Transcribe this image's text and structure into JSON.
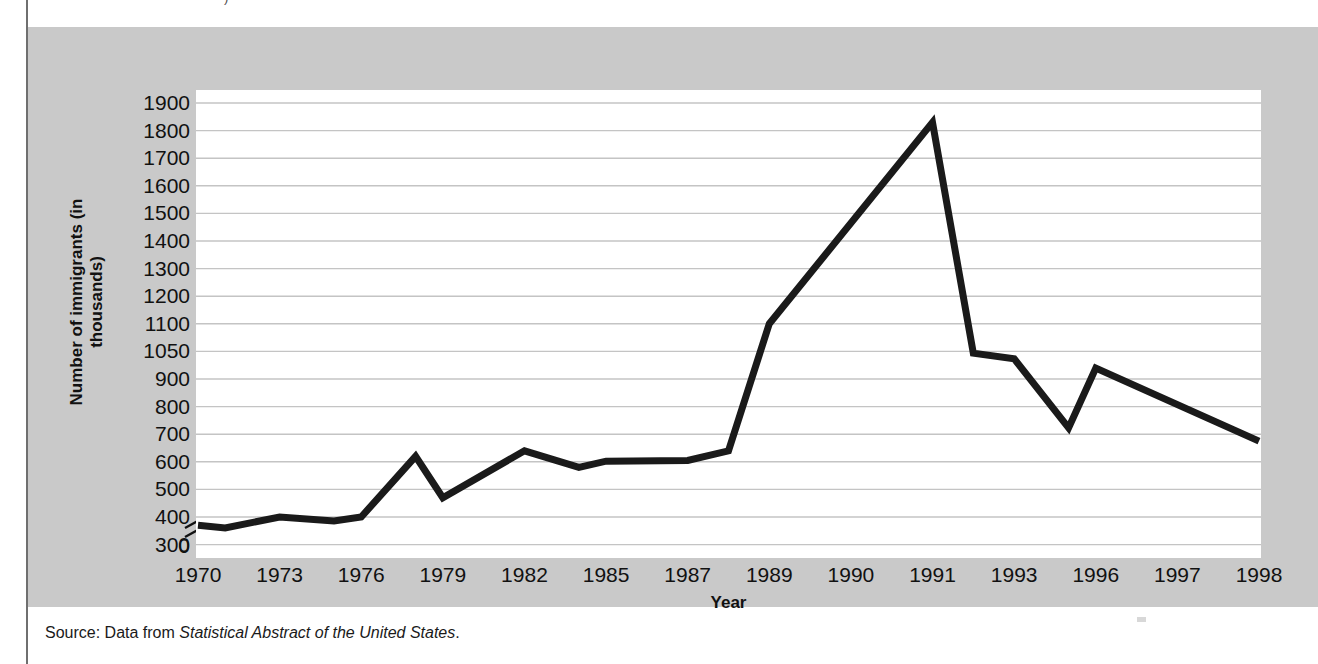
{
  "figure": {
    "top_fragment": ")",
    "source_prefix": "Source: Data from ",
    "source_italic": "Statistical Abstract of the United States",
    "source_suffix": "."
  },
  "colors": {
    "panel_background": "#c9c9c9",
    "plot_background": "#ffffff",
    "gridline": "#c4c4c4",
    "line": "#1a1a1a",
    "text": "#111111"
  },
  "chart_data": {
    "type": "line",
    "title": "",
    "xlabel": "Year",
    "ylabel": "Number of immigrants (in thousands)",
    "grid": true,
    "legend": false,
    "axis_break": true,
    "ytick_labels": [
      "1900",
      "1800",
      "1700",
      "1600",
      "1500",
      "1400",
      "1300",
      "1200",
      "1100",
      "1050",
      "900",
      "800",
      "700",
      "600",
      "500",
      "400",
      "300",
      "0"
    ],
    "xtick_labels": [
      "1970",
      "1973",
      "1976",
      "1979",
      "1982",
      "1985",
      "1987",
      "1989",
      "1990",
      "1991",
      "1993",
      "1996",
      "1997",
      "1998"
    ],
    "categories": [
      "1970",
      "1971",
      "1972",
      "1973",
      "1974",
      "1975",
      "1976",
      "1977",
      "1978",
      "1979",
      "1980",
      "1981",
      "1982",
      "1983",
      "1984",
      "1985",
      "1986",
      "1987",
      "1988",
      "1989",
      "1990",
      "1991",
      "1992",
      "1993",
      "1994",
      "1995",
      "1996",
      "1997",
      "1998"
    ],
    "series": [
      {
        "name": "Number of immigrants",
        "values": [
          370,
          360,
          375,
          400,
          395,
          386,
          400,
          460,
          620,
          470,
          530,
          597,
          640,
          620,
          600,
          580,
          602,
          602,
          605,
          640,
          1100,
          1830,
          1830,
          1040,
          1010,
          960,
          723,
          960,
          675
        ]
      }
    ],
    "points": [
      {
        "x": "1970",
        "y": 370
      },
      {
        "x": "1971",
        "y": 360
      },
      {
        "x": "1973",
        "y": 400
      },
      {
        "x": "1975",
        "y": 386
      },
      {
        "x": "1976",
        "y": 400
      },
      {
        "x": "1978",
        "y": 620
      },
      {
        "x": "1979",
        "y": 470
      },
      {
        "x": "1982",
        "y": 640
      },
      {
        "x": "1984",
        "y": 580
      },
      {
        "x": "1985",
        "y": 602
      },
      {
        "x": "1987",
        "y": 605
      },
      {
        "x": "1988",
        "y": 640
      },
      {
        "x": "1989",
        "y": 1100
      },
      {
        "x": "1991",
        "y": 1830
      },
      {
        "x": "1992",
        "y": 1040
      },
      {
        "x": "1993",
        "y": 1010
      },
      {
        "x": "1995",
        "y": 723
      },
      {
        "x": "1996",
        "y": 960
      },
      {
        "x": "1998",
        "y": 675
      }
    ],
    "ylim_note": "non-uniform tick spacing: 1100 then 1050 then 900; broken axis between 300 and 0",
    "peak": {
      "year": "1991",
      "value": 1830
    },
    "minimum": {
      "year": "1971",
      "value": 360
    }
  }
}
